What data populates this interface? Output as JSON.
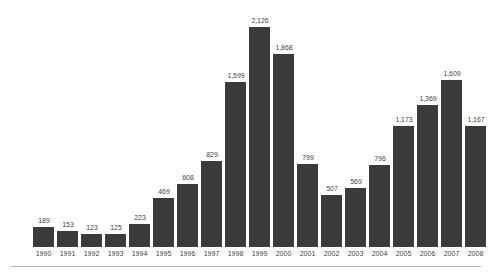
{
  "figure": {
    "name": "annual-bar-chart",
    "background_color": "#ffffff",
    "bar_color": "#3b3b3b",
    "label_color": "#414141",
    "axis_label_color": "#434343",
    "rule_color": "#b4b4b4",
    "title_remnant": "",
    "baseline_y": 247,
    "bar_width_px": 21,
    "bar_pitch_px": 24,
    "first_bar_left_px": 33,
    "px_per_unit": 0.1035
  },
  "chart_data": {
    "type": "bar",
    "title": "",
    "subtitle": "",
    "xlabel": "",
    "ylabel": "",
    "ylim": [
      0,
      2126
    ],
    "grid": false,
    "legend": false,
    "axis": {
      "y_visible": false,
      "x_visible": false,
      "value_labels_shown": true,
      "value_label_format": "comma-thousands"
    },
    "categories": [
      "1990",
      "1991",
      "1992",
      "1993",
      "1994",
      "1995",
      "1996",
      "1997",
      "1998",
      "1999",
      "2000",
      "2001",
      "2002",
      "2003",
      "2004",
      "2005",
      "2006",
      "2007",
      "2008"
    ],
    "values": [
      189,
      153,
      123,
      125,
      223,
      469,
      608,
      829,
      1599,
      2126,
      1868,
      799,
      507,
      569,
      796,
      1173,
      1369,
      1609,
      1167
    ],
    "value_labels": [
      "189",
      "153",
      "123",
      "125",
      "223",
      "469",
      "608",
      "829",
      "1,599",
      "2,126",
      "1,868",
      "799",
      "507",
      "569",
      "796",
      "1,173",
      "1,369",
      "1,609",
      "1,167"
    ]
  }
}
